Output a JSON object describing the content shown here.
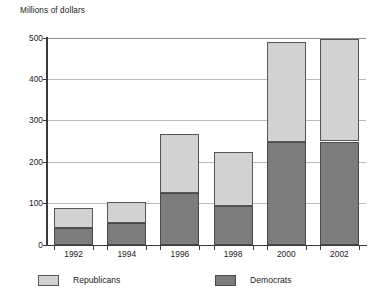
{
  "chart_data": {
    "type": "bar",
    "subtype": "stacked-vertical",
    "title": "Millions of dollars",
    "xlabel": "",
    "ylabel": "Millions of dollars",
    "categories": [
      "1992",
      "1994",
      "1996",
      "1998",
      "2000",
      "2002"
    ],
    "series": [
      {
        "name": "Democrats",
        "color": "#7c7c7c",
        "values": [
          40,
          53,
          125,
          95,
          248,
          250
        ]
      },
      {
        "name": "Republicans",
        "color": "#d2d2d2",
        "values": [
          50,
          51,
          142,
          129,
          242,
          248
        ]
      }
    ],
    "stack_totals": [
      90,
      104,
      267,
      224,
      490,
      498
    ],
    "stack_order": [
      "Democrats",
      "Republicans"
    ],
    "ylim": [
      0,
      500
    ],
    "yticks": [
      0,
      100,
      200,
      300,
      400,
      500
    ],
    "ytick_labels": [
      "0",
      "100",
      "200",
      "300",
      "400",
      "500"
    ],
    "grid": "horizontal",
    "legend_position": "bottom",
    "legend_entries": [
      "Republicans",
      "Democrats"
    ]
  },
  "axis": {
    "title": "Millions of dollars",
    "ytick_labels": [
      "500",
      "400",
      "300",
      "200",
      "100",
      "0"
    ],
    "xtick_labels": [
      "1992",
      "1994",
      "1996",
      "1998",
      "2000",
      "2002"
    ]
  },
  "legend": {
    "republicans_label": "Republicans",
    "democrats_label": "Democrats",
    "republicans_color": "#d2d2d2",
    "democrats_color": "#7c7c7c"
  }
}
